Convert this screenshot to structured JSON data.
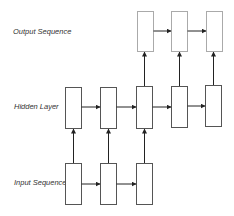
{
  "diagram": {
    "labels": {
      "output": "Output Sequence",
      "hidden": "Hidden Layer",
      "input": "Input Sequence"
    },
    "colors": {
      "box_stroke": "#555555",
      "output_box_stroke": "#aaaaaa",
      "arrow": "#222222",
      "text": "#333333",
      "background": "#ffffff"
    },
    "layers": {
      "output": {
        "count": 3,
        "boxes": [
          {
            "x": 137,
            "y": 11,
            "w": 16,
            "h": 40
          },
          {
            "x": 171,
            "y": 11,
            "w": 16,
            "h": 40
          },
          {
            "x": 206,
            "y": 11,
            "w": 16,
            "h": 40
          }
        ]
      },
      "hidden": {
        "count": 5,
        "boxes": [
          {
            "x": 65,
            "y": 87,
            "w": 16,
            "h": 41
          },
          {
            "x": 100,
            "y": 87,
            "w": 16,
            "h": 41
          },
          {
            "x": 136,
            "y": 86,
            "w": 16,
            "h": 42
          },
          {
            "x": 171,
            "y": 86,
            "w": 16,
            "h": 41
          },
          {
            "x": 205,
            "y": 85,
            "w": 16,
            "h": 41
          }
        ]
      },
      "input": {
        "count": 3,
        "boxes": [
          {
            "x": 65,
            "y": 163,
            "w": 16,
            "h": 41
          },
          {
            "x": 100,
            "y": 163,
            "w": 16,
            "h": 41
          },
          {
            "x": 136,
            "y": 163,
            "w": 16,
            "h": 41
          }
        ]
      }
    }
  }
}
